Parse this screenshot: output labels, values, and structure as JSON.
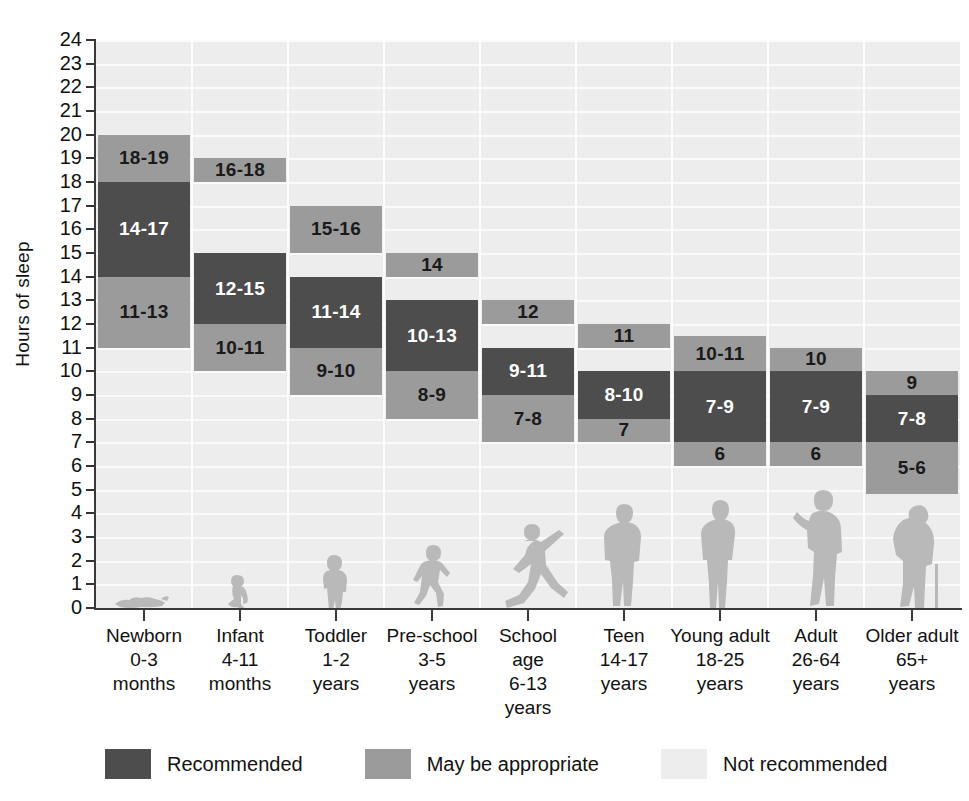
{
  "chart_data": {
    "type": "bar",
    "title": "",
    "subtitle": "",
    "xlabel": "",
    "ylabel": "Hours of sleep",
    "ylim": [
      0,
      24
    ],
    "ytick_values": [
      0,
      1,
      2,
      3,
      4,
      5,
      6,
      7,
      8,
      9,
      10,
      11,
      12,
      13,
      14,
      15,
      16,
      17,
      18,
      19,
      20,
      21,
      22,
      23,
      24
    ],
    "ytick_labels": [
      "0",
      "1",
      "2",
      "3",
      "4",
      "5",
      "6",
      "7",
      "8",
      "9",
      "10",
      "11",
      "12",
      "13",
      "14",
      "15",
      "16",
      "17",
      "18",
      "19",
      "20",
      "21",
      "22",
      "23",
      "24"
    ],
    "grid": true,
    "legend_position": "bottom",
    "categories": [
      "Newborn 0-3 months",
      "Infant 4-11 months",
      "Toddler 1-2 years",
      "Pre-school 3-5 years",
      "School age 6-13 years",
      "Teen 14-17 years",
      "Young adult 18-25 years",
      "Adult 26-64 years",
      "Older adult 65+ years"
    ],
    "series": [
      {
        "name": "May be appropriate (upper)",
        "color": "#9b9b9b",
        "ranges": [
          [
            18,
            20
          ],
          [
            18,
            19
          ],
          [
            15,
            17
          ],
          [
            14,
            15
          ],
          [
            12,
            13
          ],
          [
            11,
            12
          ],
          [
            10,
            11
          ],
          [
            10,
            11
          ],
          [
            9,
            10
          ]
        ],
        "labels": [
          "18-19",
          "16-18",
          "15-16",
          "14",
          "12",
          "11",
          "10-11",
          "10",
          "9"
        ]
      },
      {
        "name": "Recommended",
        "color": "#4d4d4d",
        "ranges": [
          [
            14,
            18
          ],
          [
            12,
            15
          ],
          [
            11,
            14
          ],
          [
            10,
            13
          ],
          [
            9,
            11
          ],
          [
            8,
            10
          ],
          [
            7,
            9
          ],
          [
            7,
            9
          ],
          [
            7,
            8
          ]
        ],
        "labels": [
          "14-17",
          "12-15",
          "11-14",
          "10-13",
          "9-11",
          "8-10",
          "7-9",
          "7-9",
          "7-8"
        ]
      },
      {
        "name": "May be appropriate (lower)",
        "color": "#9b9b9b",
        "ranges": [
          [
            11,
            14
          ],
          [
            10,
            12
          ],
          [
            9,
            11
          ],
          [
            8,
            10
          ],
          [
            7,
            9
          ],
          [
            7,
            8
          ],
          [
            6,
            7
          ],
          [
            6,
            7
          ],
          [
            5,
            7
          ]
        ],
        "labels": [
          "11-13",
          "10-11",
          "9-10",
          "8-9",
          "7-8",
          "7",
          "6",
          "6",
          "5-6"
        ]
      }
    ]
  },
  "axis": {
    "y_title": "Hours of sleep",
    "y_ticks": [
      "24",
      "23",
      "22",
      "21",
      "20",
      "19",
      "18",
      "17",
      "16",
      "15",
      "14",
      "13",
      "12",
      "11",
      "10",
      "9",
      "8",
      "7",
      "6",
      "5",
      "4",
      "3",
      "2",
      "1",
      "0"
    ]
  },
  "x_categories": [
    {
      "line1": "Newborn",
      "line2": "0-3",
      "line3": "months",
      "figure": "baby-lying-icon"
    },
    {
      "line1": "Infant",
      "line2": "4-11",
      "line3": "months",
      "figure": "baby-crawling-icon"
    },
    {
      "line1": "Toddler",
      "line2": "1-2",
      "line3": "years",
      "figure": "toddler-standing-icon"
    },
    {
      "line1": "Pre-school",
      "line2": "3-5",
      "line3": "years",
      "figure": "child-running-icon"
    },
    {
      "line1": "School",
      "line2": "age 6-13",
      "line3": "years",
      "figure": "child-playing-icon"
    },
    {
      "line1": "Teen",
      "line2": "14-17",
      "line3": "years",
      "figure": "teen-standing-icon"
    },
    {
      "line1": "Young adult",
      "line2": "18-25",
      "line3": "years",
      "figure": "young-adult-standing-icon"
    },
    {
      "line1": "Adult",
      "line2": "26-64",
      "line3": "years",
      "figure": "adult-standing-icon"
    },
    {
      "line1": "Older adult",
      "line2": "65+",
      "line3": "years",
      "figure": "older-adult-cane-icon"
    }
  ],
  "x_school_lines": {
    "line1": "School",
    "line2": "age",
    "line3": "6-13",
    "line4": "years"
  },
  "bars": [
    {
      "group": "Newborn",
      "upper_label": "18-19",
      "upper_from": 18,
      "upper_to": 20,
      "rec_label": "14-17",
      "rec_from": 14,
      "rec_to": 18,
      "lower_label": "11-13",
      "lower_from": 11,
      "lower_to": 14
    },
    {
      "group": "Infant",
      "upper_label": "16-18",
      "upper_from": 18,
      "upper_to": 19,
      "rec_label": "12-15",
      "rec_from": 12,
      "rec_to": 15,
      "lower_label": "10-11",
      "lower_from": 10,
      "lower_to": 12
    },
    {
      "group": "Toddler",
      "upper_label": "15-16",
      "upper_from": 15,
      "upper_to": 17,
      "rec_label": "11-14",
      "rec_from": 11,
      "rec_to": 14,
      "lower_label": "9-10",
      "lower_from": 9,
      "lower_to": 11
    },
    {
      "group": "Pre-school",
      "upper_label": "14",
      "upper_from": 14,
      "upper_to": 15,
      "rec_label": "10-13",
      "rec_from": 10,
      "rec_to": 13,
      "lower_label": "8-9",
      "lower_from": 8,
      "lower_to": 10
    },
    {
      "group": "School age",
      "upper_label": "12",
      "upper_from": 12,
      "upper_to": 13,
      "rec_label": "9-11",
      "rec_from": 9,
      "rec_to": 11,
      "lower_label": "7-8",
      "lower_from": 7,
      "lower_to": 9
    },
    {
      "group": "Teen",
      "upper_label": "11",
      "upper_from": 11,
      "upper_to": 12,
      "rec_label": "8-10",
      "rec_from": 8,
      "rec_to": 10,
      "lower_label": "7",
      "lower_from": 7,
      "lower_to": 8
    },
    {
      "group": "Young adult",
      "upper_label": "10-11",
      "upper_from": 10,
      "upper_to": 11.5,
      "rec_label": "7-9",
      "rec_from": 7,
      "rec_to": 10,
      "lower_label": "6",
      "lower_from": 6,
      "lower_to": 7
    },
    {
      "group": "Adult",
      "upper_label": "10",
      "upper_from": 10,
      "upper_to": 11,
      "rec_label": "7-9",
      "rec_from": 7,
      "rec_to": 10,
      "lower_label": "6",
      "lower_from": 6,
      "lower_to": 7
    },
    {
      "group": "Older adult",
      "upper_label": "9",
      "upper_from": 9,
      "upper_to": 10,
      "rec_label": "7-8",
      "rec_from": 7,
      "rec_to": 9,
      "lower_label": "5-6",
      "lower_from": 4.8,
      "lower_to": 7
    }
  ],
  "legend": {
    "items": [
      {
        "label": "Recommended",
        "color": "#4d4d4d"
      },
      {
        "label": "May be appropriate",
        "color": "#9b9b9b"
      },
      {
        "label": "Not recommended",
        "color": "#ededed"
      }
    ]
  },
  "colors": {
    "recommended": "#4d4d4d",
    "may_be_appropriate": "#9b9b9b",
    "not_recommended": "#ededed",
    "figure": "#b9b9b9",
    "axis": "#3a3a3a"
  }
}
